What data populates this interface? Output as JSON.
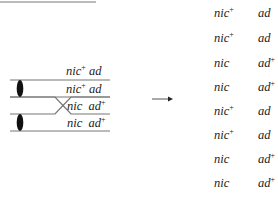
{
  "header_fragment": "tetrad should be",
  "diagram": {
    "chromatids": [
      {
        "gene1": "nic",
        "gene1_sup": "+",
        "gene2": "ad",
        "gene2_sup": ""
      },
      {
        "gene1": "nic",
        "gene1_sup": "+",
        "gene2": "ad",
        "gene2_sup": ""
      },
      {
        "gene1": "nic",
        "gene1_sup": "",
        "gene2": "ad",
        "gene2_sup": "+"
      },
      {
        "gene1": "nic",
        "gene1_sup": "",
        "gene2": "ad",
        "gene2_sup": "+"
      }
    ],
    "arrow": "→",
    "crossover": "between chromatids 2 and 3",
    "centromeres": 2
  },
  "result": {
    "spores": [
      {
        "gene1": "nic",
        "gene1_sup": "+",
        "gene2": "ad",
        "gene2_sup": ""
      },
      {
        "gene1": "nic",
        "gene1_sup": "+",
        "gene2": "ad",
        "gene2_sup": ""
      },
      {
        "gene1": "nic",
        "gene1_sup": "",
        "gene2": "ad",
        "gene2_sup": "+"
      },
      {
        "gene1": "nic",
        "gene1_sup": "",
        "gene2": "ad",
        "gene2_sup": "+"
      },
      {
        "gene1": "nic",
        "gene1_sup": "+",
        "gene2": "ad",
        "gene2_sup": ""
      },
      {
        "gene1": "nic",
        "gene1_sup": "+",
        "gene2": "ad",
        "gene2_sup": ""
      },
      {
        "gene1": "nic",
        "gene1_sup": "",
        "gene2": "ad",
        "gene2_sup": "+"
      },
      {
        "gene1": "nic",
        "gene1_sup": "",
        "gene2": "ad",
        "gene2_sup": "+"
      }
    ]
  }
}
